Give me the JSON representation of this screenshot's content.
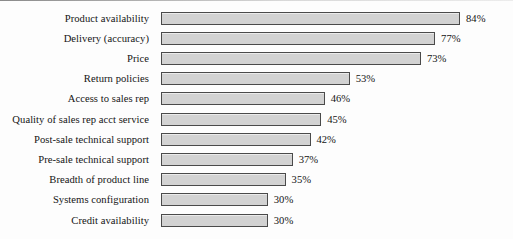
{
  "chart_data": {
    "type": "bar",
    "orientation": "horizontal",
    "title": "",
    "subtitle": "",
    "xlabel": "",
    "ylabel": "",
    "xlim": [
      0,
      100
    ],
    "grid": false,
    "legend": null,
    "value_suffix": "%",
    "categories": [
      "Product availability",
      "Delivery (accuracy)",
      "Price",
      "Return policies",
      "Access to sales rep",
      "Quality of sales rep acct service",
      "Post-sale technical support",
      "Pre-sale technical support",
      "Breadth of product line",
      "Systems configuration",
      "Credit availability"
    ],
    "values": [
      84,
      77,
      73,
      53,
      46,
      45,
      42,
      37,
      35,
      30,
      30
    ],
    "value_labels": [
      "84%",
      "77%",
      "73%",
      "53%",
      "46%",
      "45%",
      "42%",
      "37%",
      "35%",
      "30%",
      "30%"
    ],
    "colors": {
      "bar_fill": "#d2d2d2",
      "bar_border": "#4a4a4a",
      "text": "#141414",
      "background": "#fdfdfd"
    }
  }
}
